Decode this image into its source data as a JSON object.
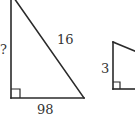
{
  "diagram": {
    "type": "right-triangles",
    "colors": {
      "line": "#2a2a2a",
      "label": "#333333",
      "background": "#ffffff"
    },
    "triangles": [
      {
        "id": "left",
        "labels": {
          "vertical_leg": "?",
          "hypotenuse": "16",
          "base": "98"
        },
        "right_angle_marker": true
      },
      {
        "id": "right",
        "labels": {
          "vertical_leg": "3"
        },
        "right_angle_marker": true,
        "partially_visible": true
      }
    ]
  }
}
